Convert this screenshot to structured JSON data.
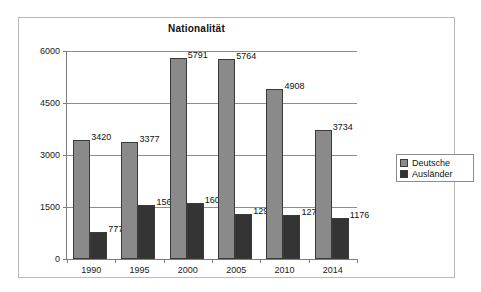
{
  "chart_data": {
    "type": "bar",
    "title": "Nationalität",
    "xlabel": "",
    "ylabel": "",
    "categories": [
      "1990",
      "1995",
      "2000",
      "2005",
      "2010",
      "2014"
    ],
    "series": [
      {
        "name": "Deutsche",
        "color": "#8a8a8a",
        "values": [
          3420,
          3377,
          5791,
          5764,
          4908,
          3734
        ]
      },
      {
        "name": "Ausländer",
        "color": "#343434",
        "values": [
          777,
          1567,
          1605,
          1297,
          1276,
          1176
        ]
      }
    ],
    "ylim": [
      0,
      6000
    ],
    "yticks": [
      "0",
      "1500",
      "3000",
      "4500",
      "6000"
    ],
    "ytick_values": [
      0,
      1500,
      3000,
      4500,
      6000
    ],
    "grid": true,
    "legend_position": "right",
    "data_labels": true
  },
  "legend": {
    "items": [
      {
        "label": "Deutsche"
      },
      {
        "label": "Ausländer"
      }
    ]
  }
}
